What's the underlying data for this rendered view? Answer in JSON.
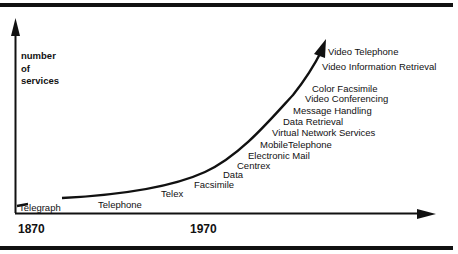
{
  "diagram": {
    "y_axis_label": [
      "number",
      "of",
      "services"
    ],
    "x_axis_ticks": [
      "1870",
      "1970"
    ],
    "services": [
      {
        "label": "Telegraph",
        "x": 19,
        "y": 203
      },
      {
        "label": "Telephone",
        "x": 98,
        "y": 200
      },
      {
        "label": "Telex",
        "x": 161,
        "y": 189
      },
      {
        "label": "Facsimile",
        "x": 194,
        "y": 180
      },
      {
        "label": "Data",
        "x": 223,
        "y": 170
      },
      {
        "label": "Centrex",
        "x": 237,
        "y": 161
      },
      {
        "label": "Electronic Mail",
        "x": 248,
        "y": 151
      },
      {
        "label": "MobileTelephone",
        "x": 260,
        "y": 140
      },
      {
        "label": "Virtual Network Services",
        "x": 272,
        "y": 128
      },
      {
        "label": "Data Retrieval",
        "x": 283,
        "y": 117
      },
      {
        "label": "Message Handling",
        "x": 293,
        "y": 106
      },
      {
        "label": "Video Conferencing",
        "x": 305,
        "y": 94
      },
      {
        "label": "Color Facsimile",
        "x": 312,
        "y": 84
      },
      {
        "label": "Video Information Retrieval",
        "x": 322,
        "y": 62
      },
      {
        "label": "Video Telephone",
        "x": 328,
        "y": 47
      }
    ]
  },
  "chart_data": {
    "type": "line",
    "title": "",
    "xlabel": "",
    "ylabel": "number of services",
    "x_ticks": [
      "1870",
      "1970"
    ],
    "series": [
      {
        "name": "growth of telecommunication services",
        "points_ordered": [
          "Telegraph",
          "Telephone",
          "Telex",
          "Facsimile",
          "Data",
          "Centrex",
          "Electronic Mail",
          "MobileTelephone",
          "Virtual Network Services",
          "Data Retrieval",
          "Message Handling",
          "Video Conferencing",
          "Color Facsimile",
          "Video Information Retrieval",
          "Video Telephone"
        ]
      }
    ],
    "grid": false,
    "legend": "none"
  }
}
